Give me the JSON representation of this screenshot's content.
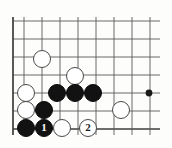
{
  "diagram": {
    "kind": "go-board-diagram",
    "board": {
      "columns": 8,
      "rows": 7,
      "cell_size": 18,
      "origin_x": 13,
      "origin_y": 21,
      "line_color": "#5a5a5a",
      "border_color": "#3c3c3c",
      "background_color": "#fdfdfc",
      "vertical_line_x": [
        13,
        24,
        42,
        60,
        78,
        96,
        114,
        132,
        150
      ],
      "horizontal_line_y": [
        21,
        39,
        57,
        75,
        93,
        111,
        129
      ],
      "right_clip_x": 160
    },
    "star_points": [
      {
        "name": "hoshi-right",
        "x": 149,
        "y": 93,
        "radius": 3.4
      }
    ],
    "stone_radius": 9.4,
    "stones": [
      {
        "id": "w-a",
        "color": "white",
        "x": 42,
        "y": 59,
        "label": ""
      },
      {
        "id": "w-b",
        "color": "white",
        "x": 75,
        "y": 76,
        "label": ""
      },
      {
        "id": "w-c",
        "color": "white",
        "x": 26,
        "y": 93,
        "label": ""
      },
      {
        "id": "b-1",
        "color": "black",
        "x": 57,
        "y": 93,
        "label": ""
      },
      {
        "id": "b-2",
        "color": "black",
        "x": 75,
        "y": 93,
        "label": ""
      },
      {
        "id": "b-3",
        "color": "black",
        "x": 93,
        "y": 93,
        "label": ""
      },
      {
        "id": "w-d",
        "color": "white",
        "x": 121,
        "y": 110,
        "label": ""
      },
      {
        "id": "w-e",
        "color": "white",
        "x": 26,
        "y": 110,
        "label": ""
      },
      {
        "id": "b-4",
        "color": "black",
        "x": 44,
        "y": 110,
        "label": ""
      },
      {
        "id": "b-5",
        "color": "black",
        "x": 26,
        "y": 128,
        "label": ""
      },
      {
        "id": "b-move-1",
        "color": "black",
        "x": 44,
        "y": 128,
        "label": "1"
      },
      {
        "id": "w-f",
        "color": "white",
        "x": 62,
        "y": 128,
        "label": ""
      },
      {
        "id": "w-move-2",
        "color": "white",
        "x": 88,
        "y": 128,
        "label": "2"
      }
    ]
  }
}
